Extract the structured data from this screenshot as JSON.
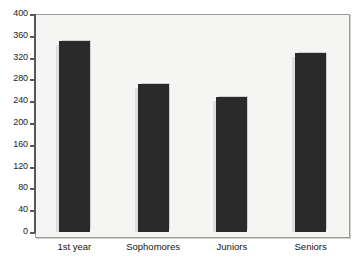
{
  "chart_data": {
    "type": "bar",
    "title": "",
    "xlabel": "",
    "ylabel": "",
    "categories": [
      "1st year",
      "Sophomores",
      "Juniors",
      "Seniors"
    ],
    "values": [
      350,
      272,
      248,
      328
    ],
    "ylim": [
      0,
      400
    ],
    "yticks": [
      0,
      40,
      80,
      120,
      160,
      200,
      240,
      280,
      320,
      360,
      400
    ],
    "ytick_labels": [
      "0",
      "40",
      "80",
      "120",
      "160",
      "200",
      "240",
      "280",
      "320",
      "360",
      "400"
    ],
    "grid": false,
    "legend": null,
    "bar_color": "#2a2a2a",
    "plot_background": "#f5f5f3",
    "axis_color": "#58585a",
    "frame_color": "#9a9a98"
  },
  "axes": {
    "y_labels": [
      "400",
      "360",
      "320",
      "280",
      "240",
      "200",
      "160",
      "120",
      "80",
      "40",
      "0"
    ],
    "x_labels": [
      "1st year",
      "Sophomores",
      "Juniors",
      "Seniors"
    ]
  }
}
